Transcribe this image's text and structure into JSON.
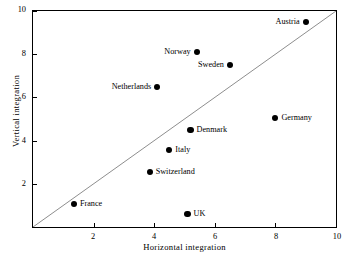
{
  "chart_data": {
    "type": "scatter",
    "title": "",
    "xlabel": "Horizontal integration",
    "ylabel": "Vertical integration",
    "xlim": [
      0,
      10
    ],
    "ylim": [
      0,
      10
    ],
    "xticks": [
      2,
      4,
      6,
      8,
      10
    ],
    "yticks": [
      2,
      4,
      6,
      8,
      10
    ],
    "xticklabels": [
      "2",
      "4",
      "6",
      "8",
      "10"
    ],
    "yticklabels": [
      "2",
      "4",
      "6",
      "8",
      "10"
    ],
    "grid": false,
    "legend": false,
    "annotations": [
      {
        "name": "diagonal-reference-line",
        "kind": "line",
        "from": [
          0,
          0
        ],
        "to": [
          10,
          10
        ],
        "color": "#000000"
      }
    ],
    "marker": {
      "shape": "circle",
      "color": "#000000",
      "size": 6
    },
    "points": [
      {
        "label": "Austria",
        "x": 9.0,
        "y": 9.5,
        "label_side": "left"
      },
      {
        "label": "Norway",
        "x": 5.4,
        "y": 8.1,
        "label_side": "left"
      },
      {
        "label": "Sweden",
        "x": 6.5,
        "y": 7.5,
        "label_side": "left"
      },
      {
        "label": "Netherlands",
        "x": 4.1,
        "y": 6.5,
        "label_side": "left"
      },
      {
        "label": "Germany",
        "x": 8.0,
        "y": 5.05,
        "label_side": "right"
      },
      {
        "label": "Denmark",
        "x": 5.2,
        "y": 4.5,
        "label_side": "right"
      },
      {
        "label": "Italy",
        "x": 4.5,
        "y": 3.55,
        "label_side": "right"
      },
      {
        "label": "Switzerland",
        "x": 3.85,
        "y": 2.55,
        "label_side": "right"
      },
      {
        "label": "France",
        "x": 1.35,
        "y": 1.05,
        "label_side": "right"
      },
      {
        "label": "UK",
        "x": 5.1,
        "y": 0.6,
        "label_side": "right"
      }
    ]
  }
}
